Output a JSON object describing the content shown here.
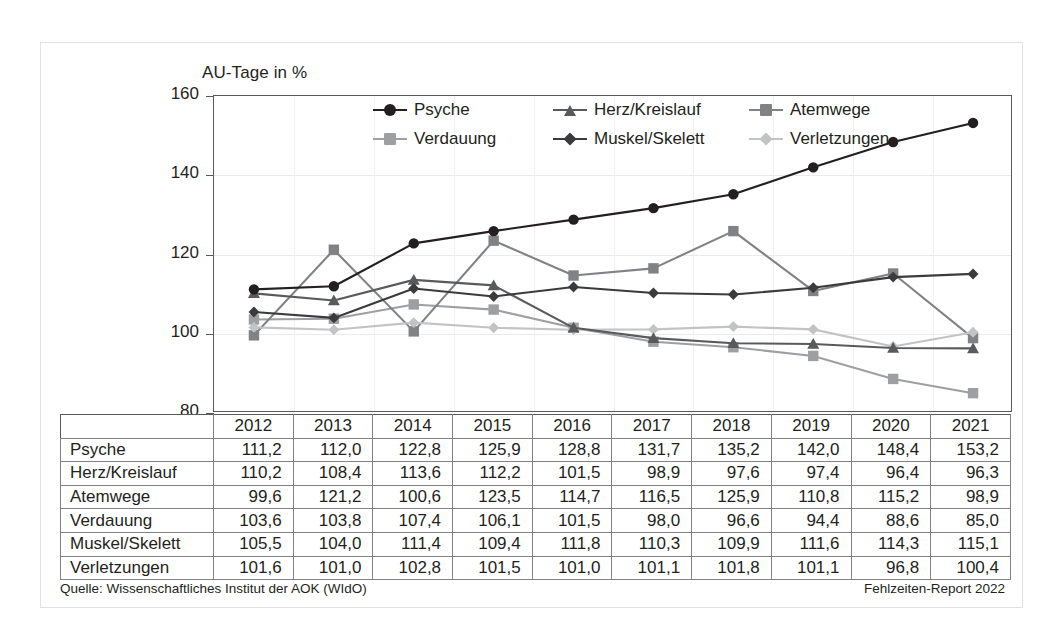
{
  "chart_title": "AU-Tage in %",
  "source_note": "Quelle: Wissenschaftliches Institut der AOK (WIdO)",
  "report_note": "Fehlzeiten-Report 2022",
  "axis": {
    "y_ticks": [
      "160",
      "140",
      "120",
      "100",
      "80"
    ],
    "ylim": [
      80,
      160
    ]
  },
  "chart_data": {
    "type": "line",
    "title": "AU-Tage in %",
    "xlabel": "",
    "ylabel": "AU-Tage in %",
    "ylim": [
      80,
      160
    ],
    "yticks": [
      80,
      100,
      120,
      140,
      160
    ],
    "grid": true,
    "legend_position": "top-center",
    "categories": [
      "2012",
      "2013",
      "2014",
      "2015",
      "2016",
      "2017",
      "2018",
      "2019",
      "2020",
      "2021"
    ],
    "series": [
      {
        "name": "Psyche",
        "color": "#231f20",
        "marker": "circle",
        "values": [
          111.2,
          112.0,
          122.8,
          125.9,
          128.8,
          131.7,
          135.2,
          142.0,
          148.4,
          153.2
        ],
        "labels": [
          "111,2",
          "112,0",
          "122,8",
          "125,9",
          "128,8",
          "131,7",
          "135,2",
          "142,0",
          "148,4",
          "153,2"
        ]
      },
      {
        "name": "Herz/Kreislauf",
        "color": "#595a5c",
        "marker": "triangle",
        "values": [
          110.2,
          108.4,
          113.6,
          112.2,
          101.5,
          98.9,
          97.6,
          97.4,
          96.4,
          96.3
        ],
        "labels": [
          "110,2",
          "108,4",
          "113,6",
          "112,2",
          "101,5",
          "98,9",
          "97,6",
          "97,4",
          "96,4",
          "96,3"
        ]
      },
      {
        "name": "Atemwege",
        "color": "#808285",
        "marker": "square",
        "values": [
          99.6,
          121.2,
          100.6,
          123.5,
          114.7,
          116.5,
          125.9,
          110.8,
          115.2,
          98.9
        ],
        "labels": [
          "99,6",
          "121,2",
          "100,6",
          "123,5",
          "114,7",
          "116,5",
          "125,9",
          "110,8",
          "115,2",
          "98,9"
        ]
      },
      {
        "name": "Verdauung",
        "color": "#9d9fa2",
        "marker": "square",
        "values": [
          103.6,
          103.8,
          107.4,
          106.1,
          101.5,
          98.0,
          96.6,
          94.4,
          88.6,
          85.0
        ],
        "labels": [
          "103,6",
          "103,8",
          "107,4",
          "106,1",
          "101,5",
          "98,0",
          "96,6",
          "94,4",
          "88,6",
          "85,0"
        ]
      },
      {
        "name": "Muskel/Skelett",
        "color": "#3b3b3d",
        "marker": "diamond",
        "values": [
          105.5,
          104.0,
          111.4,
          109.4,
          111.8,
          110.3,
          109.9,
          111.6,
          114.3,
          115.1
        ],
        "labels": [
          "105,5",
          "104,0",
          "111,4",
          "109,4",
          "111,8",
          "110,3",
          "109,9",
          "111,6",
          "114,3",
          "115,1"
        ]
      },
      {
        "name": "Verletzungen",
        "color": "#c2c3c5",
        "marker": "diamond",
        "values": [
          101.6,
          101.0,
          102.8,
          101.5,
          101.0,
          101.1,
          101.8,
          101.1,
          96.8,
          100.4
        ],
        "labels": [
          "101,6",
          "101,0",
          "102,8",
          "101,5",
          "101,0",
          "101,1",
          "101,8",
          "101,1",
          "96,8",
          "100,4"
        ]
      }
    ]
  }
}
